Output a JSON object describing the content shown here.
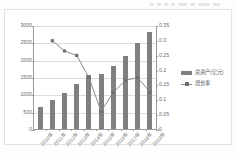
{
  "chart_data": {
    "type": "bar",
    "title": "",
    "xlabel": "",
    "ylabel": "",
    "grid": true,
    "legend_position": "right",
    "categories": [
      "2010年",
      "2011年",
      "2012年",
      "2013年",
      "2014年",
      "2015年",
      "2016年",
      "2017年",
      "2018年",
      "2019年"
    ],
    "series": [
      {
        "name": "总资产(亿元)",
        "type": "bar",
        "axis": "left",
        "color": "#808080",
        "values": [
          630,
          830,
          1050,
          1310,
          1545,
          1590,
          1805,
          2115,
          2485,
          2785
        ]
      },
      {
        "name": "增长率",
        "type": "line",
        "axis": "right",
        "color": "#8a8a8a",
        "values": [
          null,
          0.3,
          0.265,
          0.25,
          0.175,
          0.06,
          0.125,
          0.165,
          0.175,
          0.125
        ]
      }
    ],
    "ylim": [
      0,
      3000
    ],
    "yticks": [
      0,
      500,
      1000,
      1500,
      2000,
      2500,
      3000
    ],
    "ytick_labels": [
      "0",
      "500",
      "1000",
      "1500",
      "2000",
      "2500",
      "3000"
    ],
    "y2lim": [
      0,
      0.35
    ],
    "y2ticks": [
      0,
      0.05,
      0.1,
      0.15,
      0.2,
      0.25,
      0.3,
      0.35
    ],
    "y2tick_labels": [
      "0",
      "0.05",
      "0.1",
      "0.15",
      "0.2",
      "0.25",
      "0.3",
      "0.35"
    ]
  },
  "legend": {
    "items": [
      {
        "label": "总资产(亿元)",
        "marker": "bar-swatch"
      },
      {
        "label": "增长率",
        "marker": "line-marker-swatch"
      }
    ]
  }
}
